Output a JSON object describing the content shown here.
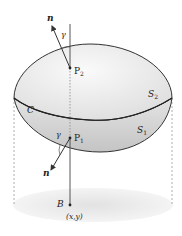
{
  "diagram": {
    "labels": {
      "normal_top": "n",
      "normal_bottom": "n",
      "angle_top": "γ",
      "angle_bottom": "γ",
      "point_top": "P",
      "point_top_sub": "2",
      "point_bottom": "P",
      "point_bottom_sub": "1",
      "curve": "C",
      "surface_top": "S",
      "surface_top_sub": "2",
      "surface_bottom": "S",
      "surface_bottom_sub": "1",
      "region": "B",
      "coords": "(x,y)"
    },
    "colors": {
      "line": "#333333",
      "surface_light": "#f2f2f2",
      "surface_dark": "#cfcfcf",
      "shadow": "#e6e6e6",
      "dashed": "#999999"
    }
  }
}
